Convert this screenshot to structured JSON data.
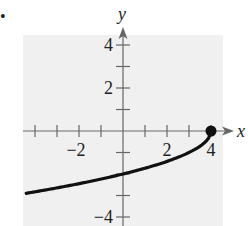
{
  "bullet": "•",
  "chart_data": {
    "type": "line",
    "title": "",
    "xlabel": "x",
    "ylabel": "y",
    "xlim": [
      -4.5,
      4.5
    ],
    "ylim": [
      -4.3,
      4.6
    ],
    "grid": false,
    "background": "#f0f0f0",
    "x_ticks": [
      -4,
      -3,
      -2,
      -1,
      1,
      2,
      3,
      4
    ],
    "x_tick_labels": [
      {
        "value": -2,
        "label": "−2"
      },
      {
        "value": 2,
        "label": "2"
      },
      {
        "value": 4,
        "label": "4"
      }
    ],
    "y_ticks": [
      4,
      3,
      2,
      1,
      -1,
      -2,
      -3,
      -4
    ],
    "y_tick_labels": [
      {
        "value": 4,
        "label": "4"
      },
      {
        "value": 2,
        "label": "2"
      },
      {
        "value": -4,
        "label": "−4"
      }
    ],
    "series": [
      {
        "name": "curve",
        "description": "y = -sqrt(4 - x)",
        "x": [
          -4.4,
          -4,
          -3,
          -2,
          -1,
          0,
          1,
          2,
          3,
          3.5,
          3.8,
          4
        ],
        "y": [
          -2.98,
          -2.83,
          -2.65,
          -2.45,
          -2.24,
          -2.0,
          -1.73,
          -1.41,
          -1.0,
          -0.71,
          -0.45,
          0
        ],
        "color": "#111111"
      }
    ],
    "points": [
      {
        "x": 4,
        "y": 0,
        "style": "filled-dot"
      }
    ]
  }
}
